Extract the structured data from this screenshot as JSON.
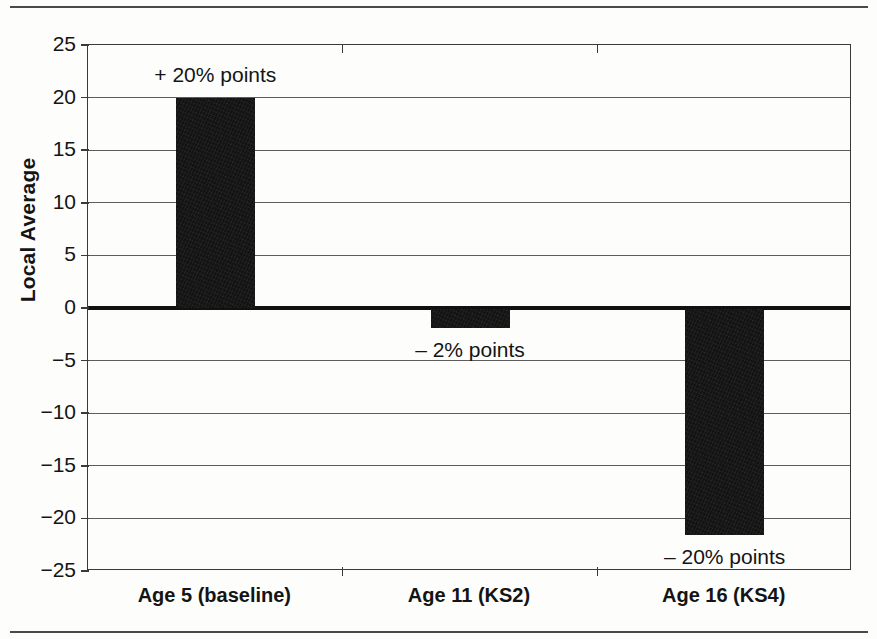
{
  "chart_data": {
    "type": "bar",
    "title": "",
    "xlabel": "",
    "ylabel": "Local Average",
    "categories": [
      "Age 5 (baseline)",
      "Age 11 (KS2)",
      "Age 16 (KS4)"
    ],
    "values": [
      20,
      -1.8,
      -21.5
    ],
    "data_labels": [
      "+ 20% points",
      "– 2% points",
      "– 20% points"
    ],
    "ylim": [
      -25,
      25
    ],
    "ytick_labels": [
      "25",
      "20",
      "15",
      "10",
      "5",
      "0",
      "−5",
      "−10",
      "−15",
      "−20",
      "−25"
    ],
    "ytick_values": [
      25,
      20,
      15,
      10,
      5,
      0,
      -5,
      -10,
      -15,
      -20,
      -25
    ],
    "grid": true,
    "legend": "none",
    "bar_color": "#131313",
    "axis_color": "#3a3a3a",
    "grid_color": "#5d5d5d",
    "zero_line_color": "#111111",
    "background_color": "#fdfdfc"
  },
  "series_label": "Local Average"
}
